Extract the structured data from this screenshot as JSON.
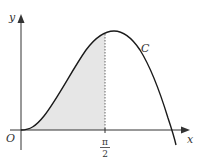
{
  "figure": {
    "axes": {
      "x_label": "x",
      "y_label": "y",
      "origin_label": "O"
    },
    "curve_label": "C",
    "x_tick": {
      "numerator": "π",
      "denominator": "2"
    },
    "shaded_region": "area under C between x = 0 and x = π/2",
    "colors": {
      "curve": "#1a1a1a",
      "axes": "#333333",
      "shade": "#e6e6e6",
      "dashed": "#666666"
    }
  }
}
